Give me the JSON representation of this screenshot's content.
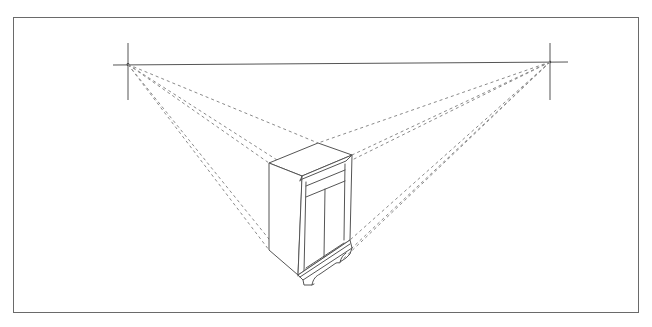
{
  "diagram": {
    "colors": {
      "background": "#ffffff",
      "frame": "#6a6a6a",
      "line": "#555555",
      "dashed": "#8a8a8a"
    },
    "frame": {
      "x": 13,
      "y": 17,
      "width": 625,
      "height": 295
    },
    "horizon_line": {
      "x1": 113,
      "y1": 65,
      "x2": 568,
      "y2": 62
    },
    "vanishing_points": [
      {
        "name": "left",
        "x": 128,
        "y": 64.5,
        "tick": {
          "y1": 43,
          "y2": 100
        }
      },
      {
        "name": "right",
        "x": 550,
        "y": 62,
        "tick": {
          "y1": 43,
          "y2": 100
        }
      }
    ],
    "construction_lines_left": [
      {
        "x2": 318,
        "y2": 143
      },
      {
        "x2": 302,
        "y2": 176
      },
      {
        "x2": 269,
        "y2": 163
      },
      {
        "x2": 269,
        "y2": 250
      },
      {
        "x2": 298,
        "y2": 275
      }
    ],
    "construction_lines_right": [
      {
        "x2": 318,
        "y2": 143
      },
      {
        "x2": 352,
        "y2": 155
      },
      {
        "x2": 302,
        "y2": 176
      },
      {
        "x2": 350,
        "y2": 240
      },
      {
        "x2": 352,
        "y2": 248
      },
      {
        "x2": 298,
        "y2": 275
      }
    ]
  }
}
